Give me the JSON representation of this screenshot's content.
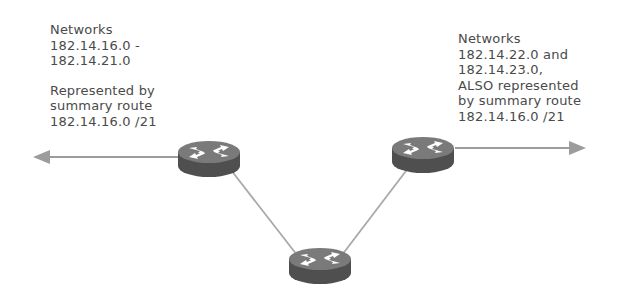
{
  "diagram": {
    "left_label": {
      "block1": [
        "Networks",
        "182.14.16.0 -",
        "182.14.21.0"
      ],
      "block2": [
        "Represented by",
        "summary route",
        "182.14.16.0 /21"
      ]
    },
    "right_label": {
      "lines": [
        "Networks",
        "182.14.22.0 and",
        "182.14.23.0,",
        "ALSO represented",
        "by summary route",
        "182.14.16.0 /21"
      ]
    },
    "nodes": [
      {
        "id": "router-left",
        "type": "router",
        "cx": 208,
        "cy": 157
      },
      {
        "id": "router-right",
        "type": "router",
        "cx": 422,
        "cy": 153
      },
      {
        "id": "router-bottom",
        "type": "router",
        "cx": 320,
        "cy": 265
      }
    ],
    "links": [
      {
        "from": "router-left",
        "to": "router-bottom"
      },
      {
        "from": "router-right",
        "to": "router-bottom"
      }
    ],
    "arrows": [
      {
        "id": "arrow-left",
        "direction": "left",
        "from_x": 178,
        "to_x": 33,
        "y": 157
      },
      {
        "id": "arrow-right",
        "direction": "right",
        "from_x": 455,
        "to_x": 586,
        "y": 148
      }
    ],
    "colors": {
      "text": "#4a4a4a",
      "router_body": "#5c5c5c",
      "router_top": "#7a7a7a",
      "router_arrows": "#ffffff",
      "link": "#a8a8a8",
      "arrow": "#9c9c9c"
    }
  }
}
